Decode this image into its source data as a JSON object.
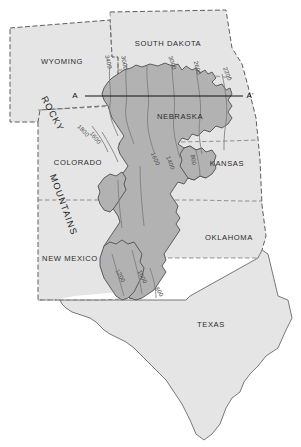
{
  "map": {
    "title": "High Plains Aquifer water-table elevation map",
    "background_color": "#ffffff",
    "region_fill": "#e2e2e2",
    "aquifer_fill": "#b0b0b0",
    "state_border_color": "#6e6e6e",
    "outline_color": "#4d4d4d",
    "contour_color": "#7a7a7a",
    "section_line_color": "#111111"
  },
  "states": [
    {
      "name": "WYOMING",
      "x": 62,
      "y": 62
    },
    {
      "name": "SOUTH DAKOTA",
      "x": 168,
      "y": 44
    },
    {
      "name": "NEBRASKA",
      "x": 180,
      "y": 117
    },
    {
      "name": "COLORADO",
      "x": 78,
      "y": 163
    },
    {
      "name": "KANSAS",
      "x": 227,
      "y": 164
    },
    {
      "name": "NEW MEXICO",
      "x": 70,
      "y": 259
    },
    {
      "name": "OKLAHOMA",
      "x": 229,
      "y": 238
    },
    {
      "name": "TEXAS",
      "x": 211,
      "y": 325
    }
  ],
  "physiographic_labels": [
    {
      "name": "ROCKY",
      "x": 52,
      "y": 114,
      "rotation": 62
    },
    {
      "name": "MOUNTAINS",
      "x": 63,
      "y": 205,
      "rotation": 70
    }
  ],
  "cross_section": {
    "start_label": "A",
    "end_label": "A'",
    "start_label_x": 77,
    "end_label_x": 248,
    "label_y": 96,
    "line_start_x": 85,
    "line_end_x": 243,
    "line_y": 96
  },
  "contour_labels": [
    {
      "value": "3400",
      "x": 108,
      "y": 62,
      "rotation": 78
    },
    {
      "value": "3000",
      "x": 124,
      "y": 63,
      "rotation": 80
    },
    {
      "value": "3000",
      "x": 172,
      "y": 63,
      "rotation": 72
    },
    {
      "value": "2600",
      "x": 197,
      "y": 68,
      "rotation": 76
    },
    {
      "value": "2200",
      "x": 227,
      "y": 74,
      "rotation": 70
    },
    {
      "value": "1800",
      "x": 83,
      "y": 131,
      "rotation": 46
    },
    {
      "value": "1600",
      "x": 95,
      "y": 138,
      "rotation": 52
    },
    {
      "value": "1600",
      "x": 155,
      "y": 159,
      "rotation": 66
    },
    {
      "value": "1400",
      "x": 170,
      "y": 163,
      "rotation": 70
    },
    {
      "value": "800",
      "x": 193,
      "y": 160,
      "rotation": 80
    },
    {
      "value": "1200",
      "x": 120,
      "y": 276,
      "rotation": 62
    },
    {
      "value": "1000",
      "x": 142,
      "y": 277,
      "rotation": 64
    },
    {
      "value": "800",
      "x": 159,
      "y": 292,
      "rotation": 58
    }
  ],
  "legend": {
    "aquifer_name": "High Plains Aquifer",
    "contour_units": "feet above sea level"
  }
}
